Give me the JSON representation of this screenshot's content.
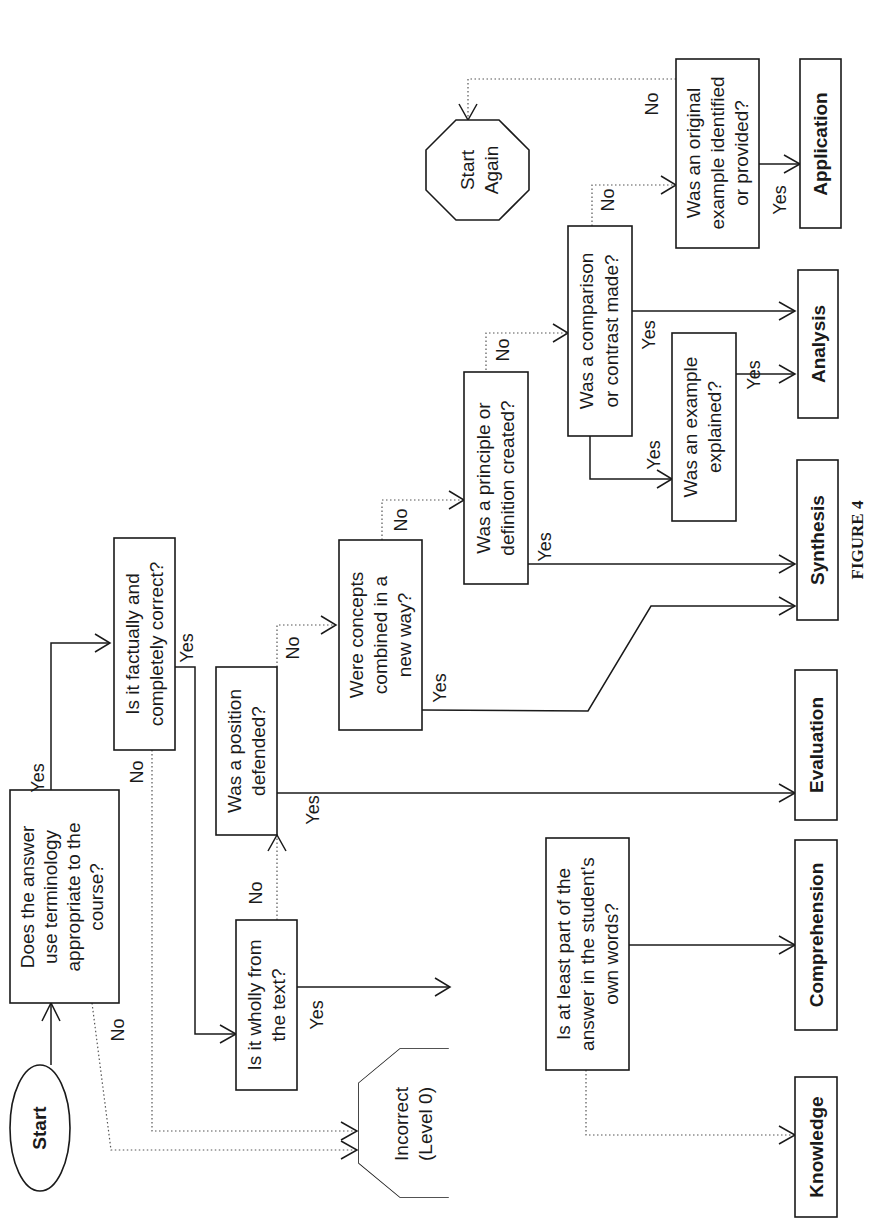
{
  "figure": {
    "caption": "FIGURE 4",
    "orientation": "rotated-90-ccw"
  },
  "nodes": {
    "start": {
      "label": "Start",
      "shape": "ellipse"
    },
    "q_terminology": {
      "lines": [
        "Does the answer",
        "use terminology",
        "appropriate to the",
        "course?"
      ]
    },
    "q_factual": {
      "lines": [
        "Is it factually and",
        "completely correct?"
      ]
    },
    "q_wholly_text": {
      "lines": [
        "Is it wholly from",
        "the text?"
      ]
    },
    "incorrect": {
      "lines": [
        "Incorrect",
        "(Level 0)"
      ],
      "shape": "octagon"
    },
    "q_position": {
      "lines": [
        "Was a position",
        "defended?"
      ]
    },
    "q_own_words": {
      "lines": [
        "Is at least part of the",
        "answer in the student's",
        "own words?"
      ]
    },
    "q_combined": {
      "lines": [
        "Were concepts",
        "combined in a",
        "new way?"
      ]
    },
    "q_principle": {
      "lines": [
        "Was a principle or",
        "definition created?"
      ]
    },
    "q_comparison": {
      "lines": [
        "Was a comparison",
        "or contrast made?"
      ]
    },
    "q_example_explained": {
      "lines": [
        "Was an example",
        "explained?"
      ]
    },
    "q_original_example": {
      "lines": [
        "Was an original",
        "example identified",
        "or provided?"
      ]
    },
    "start_again": {
      "lines": [
        "Start",
        "Again"
      ],
      "shape": "octagon"
    }
  },
  "outcomes": {
    "knowledge": "Knowledge",
    "comprehension": "Comprehension",
    "evaluation": "Evaluation",
    "synthesis": "Synthesis",
    "analysis": "Analysis",
    "application": "Application"
  },
  "edge_labels": {
    "yes": "Yes",
    "no": "No"
  },
  "edges": [
    {
      "from": "start",
      "to": "q_terminology",
      "label": ""
    },
    {
      "from": "q_terminology",
      "to": "q_factual",
      "label": "Yes"
    },
    {
      "from": "q_terminology",
      "to": "incorrect",
      "label": "No",
      "style": "dotted"
    },
    {
      "from": "q_factual",
      "to": "q_wholly_text",
      "label": "Yes"
    },
    {
      "from": "q_factual",
      "to": "incorrect",
      "label": "No",
      "style": "dotted"
    },
    {
      "from": "q_wholly_text",
      "to": "q_own_words",
      "label": "Yes"
    },
    {
      "from": "q_wholly_text",
      "to": "q_position",
      "label": "No",
      "style": "dotted"
    },
    {
      "from": "q_own_words",
      "to": "comprehension",
      "label": "Yes"
    },
    {
      "from": "q_own_words",
      "to": "knowledge",
      "label": "No",
      "style": "dotted"
    },
    {
      "from": "q_position",
      "to": "evaluation",
      "label": "Yes"
    },
    {
      "from": "q_position",
      "to": "q_combined",
      "label": "No",
      "style": "dotted"
    },
    {
      "from": "q_combined",
      "to": "synthesis",
      "label": "Yes"
    },
    {
      "from": "q_combined",
      "to": "q_principle",
      "label": "No",
      "style": "dotted"
    },
    {
      "from": "q_principle",
      "to": "synthesis",
      "label": "Yes"
    },
    {
      "from": "q_principle",
      "to": "q_comparison",
      "label": "No",
      "style": "dotted"
    },
    {
      "from": "q_comparison",
      "to": "analysis",
      "label": "Yes"
    },
    {
      "from": "q_comparison",
      "to": "q_example_explained",
      "label": "Yes"
    },
    {
      "from": "q_comparison",
      "to": "q_original_example",
      "label": "No",
      "style": "dotted"
    },
    {
      "from": "q_example_explained",
      "to": "analysis",
      "label": "Yes"
    },
    {
      "from": "q_original_example",
      "to": "application",
      "label": "Yes"
    },
    {
      "from": "q_original_example",
      "to": "start_again",
      "label": "No",
      "style": "dotted"
    }
  ]
}
